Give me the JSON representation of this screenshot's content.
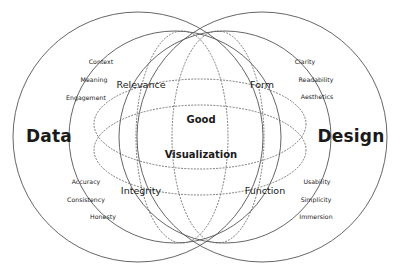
{
  "diagram": {
    "type": "venn",
    "title": "Good Visualization",
    "stroke_color": "#555555",
    "text_color": "#1a1a1a",
    "background_color": "#ffffff",
    "outer_sets": [
      {
        "name": "data",
        "label": "Data"
      },
      {
        "name": "design",
        "label": "Design"
      }
    ],
    "inner_sets": [
      {
        "name": "relevance",
        "label": "Relevance"
      },
      {
        "name": "form",
        "label": "Form"
      },
      {
        "name": "integrity",
        "label": "Integrity"
      },
      {
        "name": "function",
        "label": "Function"
      }
    ],
    "center": {
      "line1": "Good",
      "line2": "Visualization"
    },
    "attributes": {
      "data_top": [
        "Context",
        "Meaning",
        "Engagement"
      ],
      "data_bottom": [
        "Accuracy",
        "Consistency",
        "Honesty"
      ],
      "design_top": [
        "Clarity",
        "Readability",
        "Aesthetics"
      ],
      "design_bottom": [
        "Usability",
        "Simplicity",
        "Immersion"
      ]
    }
  }
}
